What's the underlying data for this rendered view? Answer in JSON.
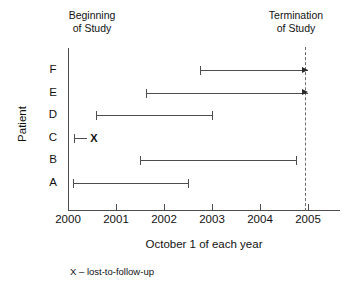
{
  "chart_data": {
    "type": "bar",
    "title": "",
    "subtitle": "",
    "xlabel": "October 1 of each year",
    "ylabel": "Patient",
    "xlim": [
      2000,
      2005.2
    ],
    "x_ticks": [
      "2000",
      "2001",
      "2002",
      "2003",
      "2004",
      "2005"
    ],
    "x_tick_values": [
      2000,
      2001,
      2002,
      2003,
      2004,
      2005
    ],
    "categories": [
      "A",
      "B",
      "C",
      "D",
      "E",
      "F"
    ],
    "grid": false,
    "legend": false,
    "annotations": {
      "left_header": "Beginning\nof Study",
      "left_header_line1": "Beginning",
      "left_header_line2": "of Study",
      "right_header_line1": "Termination",
      "right_header_line2": "of Study",
      "footnote": "X – lost-to-follow-up",
      "termination_year": 2005
    },
    "series": [
      {
        "name": "A",
        "start": 2000.1,
        "end": 2002.5,
        "start_marker": "tick",
        "end_marker": "tick",
        "outcome": "censored-at-end"
      },
      {
        "name": "B",
        "start": 2001.5,
        "end": 2004.75,
        "start_marker": "tick",
        "end_marker": "tick",
        "outcome": "censored-at-end"
      },
      {
        "name": "C",
        "start": 2000.13,
        "end": 2000.4,
        "start_marker": "tick",
        "end_marker": "X",
        "marker_label": "X",
        "outcome": "lost-to-follow-up"
      },
      {
        "name": "D",
        "start": 2000.58,
        "end": 2003.0,
        "start_marker": "tick",
        "end_marker": "tick",
        "outcome": "censored-at-end"
      },
      {
        "name": "E",
        "start": 2001.63,
        "end": 2005.0,
        "start_marker": "tick",
        "end_marker": "arrow",
        "outcome": "still-in-study-at-termination"
      },
      {
        "name": "F",
        "start": 2002.75,
        "end": 2005.0,
        "start_marker": "tick",
        "end_marker": "arrow",
        "outcome": "still-in-study-at-termination"
      }
    ]
  },
  "geometry": {
    "plot_left_px": 68,
    "plot_right_px": 308,
    "px_per_year": 48,
    "rows_top_px": 70,
    "row_step_px": 22.5
  }
}
